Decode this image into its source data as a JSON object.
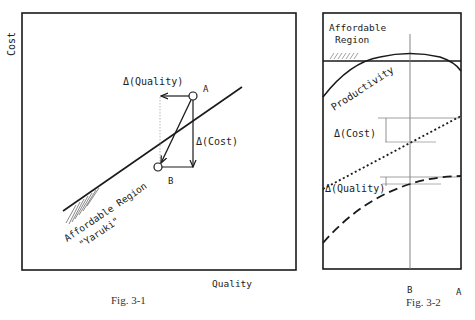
{
  "fig1": {
    "caption": "Fig. 3-1",
    "y_axis_label": "Cost",
    "x_axis_label": "Quality",
    "point_a": "A",
    "point_b": "B",
    "delta_quality": "Δ(Quality)",
    "delta_cost": "Δ(Cost)",
    "region_label_line1": "Affordable Region",
    "region_label_line2": "\"Yaruki\""
  },
  "fig2": {
    "caption": "Fig. 3-2",
    "region_label_line1": "Affordable",
    "region_label_line2": "Region",
    "productivity_label": "Productivity",
    "delta_cost": "Δ(Cost)",
    "delta_quality": "Δ(Quality)",
    "x_tick_b": "B",
    "x_tick_a": "A"
  },
  "colors": {
    "ink": "#1a1a1a",
    "grey_line": "#888888"
  }
}
